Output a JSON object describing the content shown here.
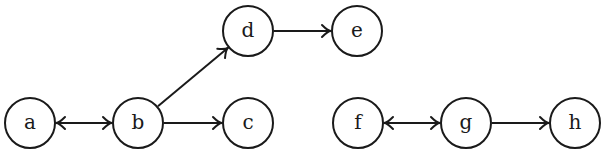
{
  "diagram": {
    "type": "directed-graph",
    "node_radius": 25,
    "nodes": [
      {
        "id": "a",
        "label": "a",
        "x": 30,
        "y": 123
      },
      {
        "id": "b",
        "label": "b",
        "x": 138,
        "y": 123
      },
      {
        "id": "c",
        "label": "c",
        "x": 248,
        "y": 123
      },
      {
        "id": "d",
        "label": "d",
        "x": 248,
        "y": 31
      },
      {
        "id": "e",
        "label": "e",
        "x": 357,
        "y": 31
      },
      {
        "id": "f",
        "label": "f",
        "x": 358,
        "y": 123
      },
      {
        "id": "g",
        "label": "g",
        "x": 466,
        "y": 123
      },
      {
        "id": "h",
        "label": "h",
        "x": 575,
        "y": 123
      }
    ],
    "edges": [
      {
        "from": "a",
        "to": "b",
        "bidirectional": true
      },
      {
        "from": "b",
        "to": "c",
        "bidirectional": false
      },
      {
        "from": "b",
        "to": "d",
        "bidirectional": false
      },
      {
        "from": "d",
        "to": "e",
        "bidirectional": false
      },
      {
        "from": "f",
        "to": "g",
        "bidirectional": true
      },
      {
        "from": "g",
        "to": "h",
        "bidirectional": false
      }
    ],
    "colors": {
      "stroke": "#1a1a1a",
      "fill": "#ffffff",
      "background": "#ffffff"
    }
  }
}
